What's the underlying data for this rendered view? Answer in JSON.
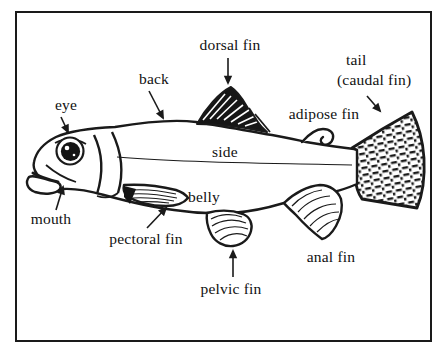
{
  "labels": {
    "eye": "eye",
    "back": "back",
    "dorsal_fin": "dorsal fin",
    "tail": "tail",
    "tail_sub": "(caudal fin)",
    "adipose_fin": "adipose fin",
    "side": "side",
    "belly": "belly",
    "mouth": "mouth",
    "pectoral_fin": "pectoral fin",
    "pelvic_fin": "pelvic fin",
    "anal_fin": "anal fin"
  },
  "colors": {
    "ink": "#1a1a1a",
    "background": "#ffffff"
  }
}
